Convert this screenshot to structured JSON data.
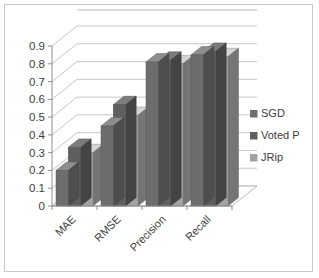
{
  "chart_data": {
    "type": "bar",
    "title": "",
    "subtitle": "",
    "xlabel": "",
    "ylabel": "",
    "categories": [
      "MAE",
      "RMSE",
      "Precision",
      "Recall"
    ],
    "series": [
      {
        "name": "SGD",
        "values": [
          0.2,
          0.45,
          0.81,
          0.85
        ],
        "color": "#6d6d6d"
      },
      {
        "name": "Voted P",
        "values": [
          0.33,
          0.57,
          0.82,
          0.87
        ],
        "color": "#5f5f5f"
      },
      {
        "name": "JRip",
        "values": [
          0.3,
          0.51,
          0.8,
          0.84
        ],
        "color": "#a3a3a3"
      }
    ],
    "ylim": [
      0,
      0.9
    ],
    "ytick_labels": [
      "0",
      "0.1",
      "0.2",
      "0.3",
      "0.4",
      "0.5",
      "0.6",
      "0.7",
      "0.8",
      "0.9"
    ],
    "ytick_values": [
      0,
      0.1,
      0.2,
      0.3,
      0.4,
      0.5,
      0.6,
      0.7,
      0.8,
      0.9
    ],
    "grid": true,
    "legend_position": "right",
    "legend_entries": [
      "SGD",
      "Voted P",
      "JRip"
    ],
    "three_d": true,
    "category_label_rotation": -45
  },
  "frame": {
    "border_color": "#c9c9c9",
    "background": "#ffffff"
  }
}
